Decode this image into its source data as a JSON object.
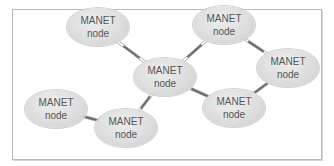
{
  "diagram": {
    "type": "network",
    "nodes": [
      {
        "id": "n1",
        "line1": "MANET",
        "line2": "node",
        "x": 98,
        "y": 27
      },
      {
        "id": "n2",
        "line1": "MANET",
        "line2": "node",
        "x": 224,
        "y": 25
      },
      {
        "id": "n3",
        "line1": "MANET",
        "line2": "node",
        "x": 165,
        "y": 77
      },
      {
        "id": "n4",
        "line1": "MANET",
        "line2": "node",
        "x": 288,
        "y": 68
      },
      {
        "id": "n5",
        "line1": "MANET",
        "line2": "node",
        "x": 56,
        "y": 109
      },
      {
        "id": "n6",
        "line1": "MANET",
        "line2": "node",
        "x": 126,
        "y": 128
      },
      {
        "id": "n7",
        "line1": "MANET",
        "line2": "node",
        "x": 234,
        "y": 108
      }
    ],
    "edges": [
      [
        "n1",
        "n3"
      ],
      [
        "n3",
        "n2"
      ],
      [
        "n2",
        "n4"
      ],
      [
        "n3",
        "n7"
      ],
      [
        "n7",
        "n4"
      ],
      [
        "n3",
        "n6"
      ],
      [
        "n5",
        "n6"
      ]
    ],
    "colors": {
      "node_fill": "#dcdcdc",
      "text": "#555555",
      "link": "#6a6a6a",
      "frame": "#b9b9b9"
    }
  }
}
